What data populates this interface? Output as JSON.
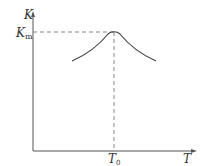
{
  "diagram": {
    "type": "curve-diagram",
    "axes": {
      "y_label": "K",
      "x_label": "T",
      "y_marker": {
        "main": "K",
        "sub": "m"
      },
      "x_marker": {
        "main": "T",
        "sub": "0"
      }
    },
    "curve": {
      "shape": "peaked",
      "peak": {
        "x_label": "T0",
        "y_label": "Km"
      }
    },
    "colors": {
      "axis": "#555555",
      "curve": "#444444",
      "dashed": "#888888",
      "text": "#333333"
    }
  }
}
